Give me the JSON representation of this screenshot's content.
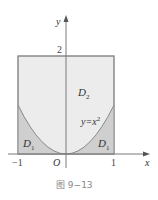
{
  "figure": {
    "caption": "图 9−13",
    "axes": {
      "x_label": "x",
      "y_label": "y",
      "origin_label": "O",
      "ticks": {
        "x_neg": "−1",
        "x_pos": "1",
        "y_top": "2"
      }
    },
    "regions": {
      "d2": {
        "label": "D",
        "sub": "2"
      },
      "d1_left": {
        "label": "D",
        "sub": "1"
      },
      "d1_right": {
        "label": "D",
        "sub": "1"
      }
    },
    "curve_label": {
      "base": "y=x",
      "sup": "2"
    },
    "colors": {
      "box_fill": "#ececec",
      "d1_fill": "#cfcfcf",
      "line": "#8a8a8a",
      "axis": "#7a7a7a"
    },
    "geometry": {
      "box": {
        "x_min": -1,
        "x_max": 1,
        "y_min": 0,
        "y_max": 2
      },
      "curve": "y = x^2, -1 <= x <= 1"
    }
  }
}
